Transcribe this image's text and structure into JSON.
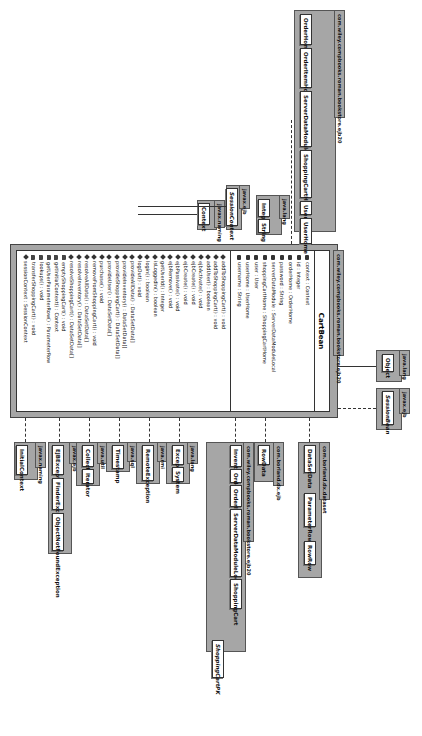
{
  "diagram": {
    "type": "UML class diagram",
    "orientation": "rotated 90 degrees clockwise"
  },
  "main_class": {
    "package": "com.wiley.compbooks.roman.bookstore.ejb20",
    "name": "CartBean",
    "attributes": [
      {
        "icon": "private-field-icon",
        "text": "context : Context"
      },
      {
        "icon": "private-field-icon",
        "text": "id : Integer"
      },
      {
        "icon": "private-field-icon",
        "text": "orderHome : OrderHome"
      },
      {
        "icon": "private-field-icon",
        "text": "password : String"
      },
      {
        "icon": "private-field-icon",
        "text": "serverDataModule : ServerDataModuleLocal"
      },
      {
        "icon": "private-field-icon",
        "text": "shoppingCartHome : ShoppingCartHome"
      },
      {
        "icon": "private-field-icon",
        "text": "user : User"
      },
      {
        "icon": "private-field-icon",
        "text": "userHome : UserHome"
      },
      {
        "icon": "private-field-icon",
        "text": "username : String"
      }
    ],
    "methods": [
      {
        "icon": "public-method-icon",
        "text": "addToShoppingCart() : void"
      },
      {
        "icon": "public-method-icon",
        "text": "addToShoppingCart() : void"
      },
      {
        "icon": "public-method-icon",
        "text": "addUser() : boolean"
      },
      {
        "icon": "public-method-icon",
        "text": "ejbActivate() : void"
      },
      {
        "icon": "public-method-icon",
        "text": "ejbCreate() : void"
      },
      {
        "icon": "public-method-icon",
        "text": "ejbCreate() : void"
      },
      {
        "icon": "public-method-icon",
        "text": "ejbPassivate() : void"
      },
      {
        "icon": "public-method-icon",
        "text": "ejbRemove() : void"
      },
      {
        "icon": "public-method-icon",
        "text": "getUserId() : Integer"
      },
      {
        "icon": "public-method-icon",
        "text": "isLoggedIn() : boolean"
      },
      {
        "icon": "public-method-icon",
        "text": "login() : boolean"
      },
      {
        "icon": "public-method-icon",
        "text": "logOut() : void"
      },
      {
        "icon": "public-method-icon",
        "text": "provideAllData() : DataSetData[]"
      },
      {
        "icon": "public-method-icon",
        "text": "provideInventory() : DataSetData[]"
      },
      {
        "icon": "public-method-icon",
        "text": "provideShoppingCart() : DataSetData[]"
      },
      {
        "icon": "public-method-icon",
        "text": "provideUser() : DataSetData[]"
      },
      {
        "icon": "public-method-icon",
        "text": "purchase() : void"
      },
      {
        "icon": "public-method-icon",
        "text": "removeFromShoppingCart() : void"
      },
      {
        "icon": "public-method-icon",
        "text": "resolveAllData() : DataSetData[]"
      },
      {
        "icon": "public-method-icon",
        "text": "resolveInventory() : DataSetData[]"
      },
      {
        "icon": "public-method-icon",
        "text": "resolveShoppingCart() : DataSetData[]"
      },
      {
        "icon": "private-method-icon",
        "text": "emptyShoppingCart() : void"
      },
      {
        "icon": "private-method-icon",
        "text": "getInitialContext() : Context"
      },
      {
        "icon": "private-method-icon",
        "text": "getUserParameterRow() : ParameterRow"
      },
      {
        "icon": "private-method-icon",
        "text": "lookups() : void"
      },
      {
        "icon": "private-method-icon",
        "text": "transferShoppingCart() : void"
      },
      {
        "icon": "public-method-icon",
        "text": "sessionContext : SessionContext"
      }
    ]
  },
  "left_packages": [
    {
      "name": "com.wiley.compbooks.roman.bookstore.ejb20",
      "classes": [
        "OrderHome",
        "OrderItemHome",
        "ServerDataModuleLocal",
        "ShoppingCartHome",
        "User",
        "UserHome"
      ]
    },
    {
      "name": "java.lang",
      "classes": [
        "Integer",
        "String"
      ]
    },
    {
      "name": "javax.ejb",
      "classes": [
        "SessionContext"
      ]
    },
    {
      "name": "javax.naming",
      "classes": [
        "Context"
      ]
    }
  ],
  "top_packages": [
    {
      "name": "java.lang",
      "classes": [
        "Object"
      ]
    },
    {
      "name": "javax.ejb",
      "classes": [
        "SessionBean"
      ]
    }
  ],
  "right_packages": [
    {
      "name": "javax.naming",
      "classes": [
        "InitialContext"
      ]
    },
    {
      "name": "javax.ejb",
      "classes": [
        "EJBException",
        "FinderException",
        "ObjectNotFoundException"
      ]
    },
    {
      "name": "java.util",
      "classes": [
        "Collection",
        "Iterator"
      ]
    },
    {
      "name": "java.sql",
      "classes": [
        "Timestamp"
      ]
    },
    {
      "name": "java.rmi",
      "classes": [
        "RemoteException"
      ]
    },
    {
      "name": "java.lang",
      "classes": [
        "Exception",
        "System"
      ]
    },
    {
      "name": "com.wiley.compbooks.roman.bookstore.ejb20",
      "classes": [
        "Inventory",
        "Order",
        "OrderItem",
        "ServerDataModuleLocalHome",
        "ShoppingCart",
        "ShoppingCartPK"
      ]
    },
    {
      "name": "com.borland.dx.ejb",
      "classes": [
        "RowData"
      ]
    },
    {
      "name": "com.borland.dx.dataset",
      "classes": [
        "DataSetData",
        "ParameterRow",
        "RowRow"
      ]
    }
  ]
}
